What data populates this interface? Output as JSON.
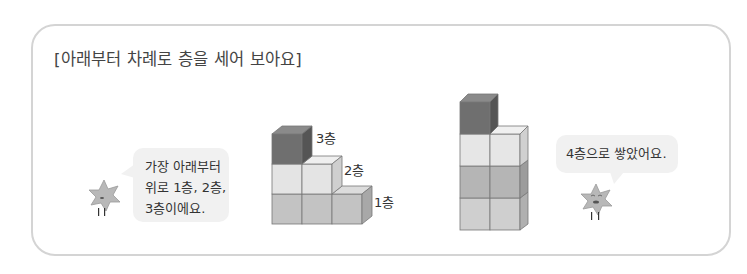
{
  "title": "[아래부터 차례로 층을 세어 보아요]",
  "left_figure": {
    "speech_bubble": {
      "lines": [
        "가장 아래부터",
        "위로 1층, 2층,",
        "3층이에요."
      ]
    },
    "floor_labels": {
      "floor3": "3층",
      "floor2": "2층",
      "floor1": "1층"
    },
    "character_icon": "star-character-icon"
  },
  "right_figure": {
    "speech_bubble": {
      "lines": [
        "4층으로 쌓았어요."
      ]
    },
    "character_icon": "star-character-icon"
  },
  "colors": {
    "panel_border": "#d4d4d4",
    "bubble_bg": "#f1f1f1",
    "cube_dark": "#6f6f6f",
    "cube_light": "#e6e6e6",
    "cube_mid": "#bdbdbd",
    "cube_base": "#cfcfcf"
  }
}
